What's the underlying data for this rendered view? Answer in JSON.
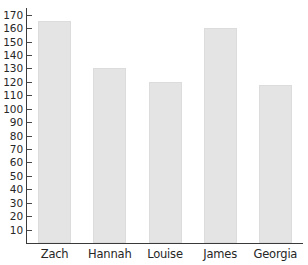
{
  "chart_data": {
    "type": "bar",
    "title": "",
    "subtitle": "",
    "xlabel": "",
    "ylabel": "",
    "categories": [
      "Zach",
      "Hannah",
      "Louise",
      "James",
      "Georgia"
    ],
    "values": [
      165,
      130,
      120,
      160,
      118
    ],
    "ylim": [
      0,
      175
    ],
    "y_ticks": [
      10,
      20,
      30,
      40,
      50,
      60,
      70,
      80,
      90,
      100,
      110,
      120,
      130,
      140,
      150,
      160,
      170
    ],
    "y_tick_labels": [
      "10",
      "20",
      "30",
      "40",
      "50",
      "60",
      "70",
      "80",
      "90",
      "100",
      "110",
      "120",
      "130",
      "140",
      "150",
      "160",
      "170"
    ],
    "grid": false,
    "legend": null,
    "legend_position": "none",
    "annotations": [],
    "colors": {
      "bar_fill": "#e4e4e4",
      "bar_edge": "#dcdcdc",
      "axis": "#3a3a3a",
      "tick_label": "#272727",
      "category_label": "#262626",
      "background": "#ffffff"
    }
  }
}
